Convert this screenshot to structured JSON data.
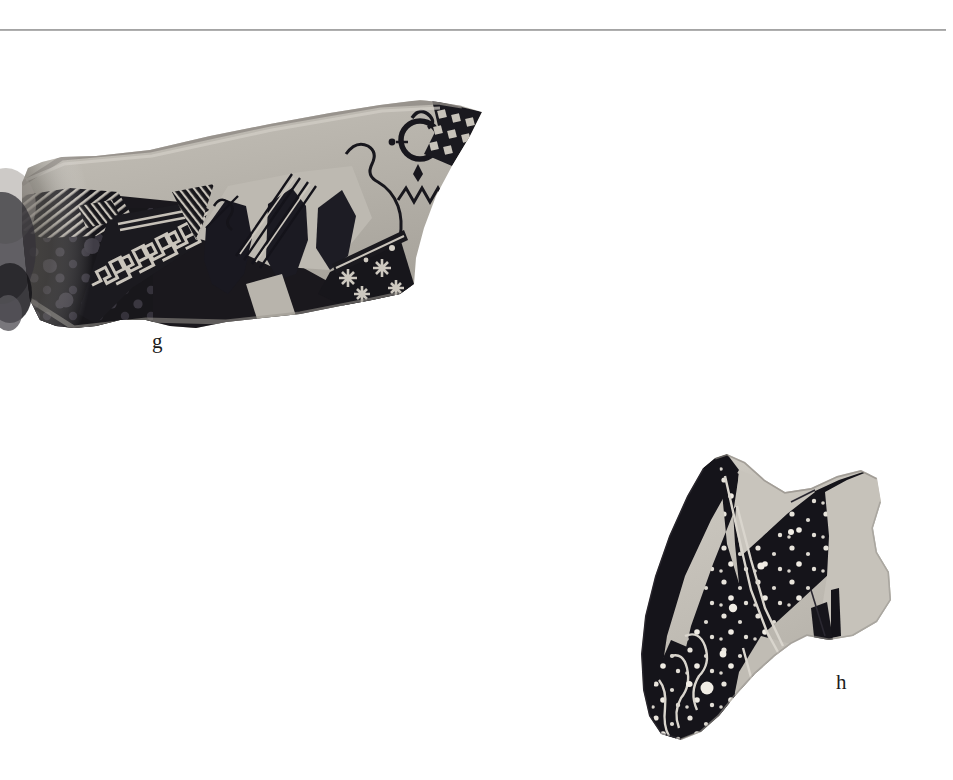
{
  "page": {
    "background_color": "#ffffff",
    "width": 953,
    "height": 780,
    "type": "archaeological-plate",
    "divider_color": "#9a9a9a"
  },
  "figures": [
    {
      "id": "g",
      "label": "g",
      "name": "pottery-sherd-g",
      "description": "Black-figure pottery sherd, elongated wedge shape, orientation sloping up to the right",
      "palette": {
        "clay": "#b0aca4",
        "clay_light": "#c3bfb7",
        "glaze": "#17161a",
        "glaze_soft": "#2c2a2e",
        "edge": "#8d8983",
        "reserve": "#cfcbc2",
        "shadow": "#6d6a66"
      },
      "motifs": [
        "meander-band",
        "hatched-triangles",
        "reserved-rosettes",
        "dot-rosettes",
        "zigzag-line",
        "incised-figures",
        "circle-motif",
        "checker-band"
      ]
    },
    {
      "id": "h",
      "label": "h",
      "name": "pottery-sherd-h",
      "description": "Black-glaze pottery sherd with white dotted speckles and reserved clay ground at right",
      "palette": {
        "clay": "#bdb9b1",
        "clay_light": "#cdc9c1",
        "glaze": "#141317",
        "dots": "#efece4",
        "edge": "#8f8b85"
      },
      "motifs": [
        "white-dot-speckles",
        "reserved-stripe",
        "incised-contour-lines",
        "wing-shape"
      ]
    }
  ],
  "labels": {
    "g": "g",
    "h": "h"
  }
}
